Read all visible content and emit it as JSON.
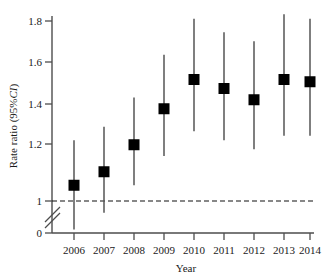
{
  "chart_data": {
    "type": "scatter",
    "title": "",
    "xlabel": "Year",
    "ylabel": "Rate ratio  (95%CI)",
    "ylabel_plain": "Rate ratio  (95%",
    "ylabel_italic": "CI",
    "ylabel_close": ")",
    "categories": [
      "2006",
      "2007",
      "2008",
      "2009",
      "2010",
      "2011",
      "2012",
      "2013",
      "2014"
    ],
    "values": [
      1.07,
      1.13,
      1.25,
      1.41,
      1.54,
      1.5,
      1.45,
      1.54,
      1.53
    ],
    "ci_low": [
      0.11,
      0.63,
      1.07,
      1.2,
      1.31,
      1.27,
      1.23,
      1.29,
      1.29
    ],
    "ci_high": [
      1.27,
      1.33,
      1.46,
      1.65,
      1.81,
      1.75,
      1.71,
      1.83,
      1.81
    ],
    "yticks": [
      "0",
      "1",
      "1.2",
      "1.4",
      "1.6",
      "1.8"
    ],
    "ytick_values": [
      0,
      1,
      1.2,
      1.4,
      1.6,
      1.8
    ],
    "ylim": [
      0,
      1.85
    ],
    "axis_break": true,
    "axis_break_between": [
      0,
      1
    ],
    "reference_line": 1,
    "reference_line_style": "dashed",
    "grid": false,
    "legend": "none",
    "marker": "filled-square",
    "marker_color": "#000000",
    "errorbar_color": "#555555",
    "axis_color": "#4d4d4d"
  }
}
